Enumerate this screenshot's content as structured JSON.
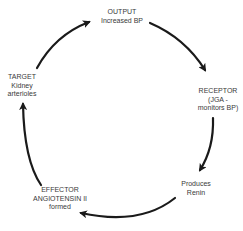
{
  "diagram": {
    "type": "cycle",
    "title": "",
    "colors": {
      "arrow": "#1a1a1a",
      "text": "#3a3a3a",
      "background": "#ffffff"
    },
    "nodes": [
      {
        "id": "output",
        "lines": [
          "OUTPUT",
          "Increased BP"
        ]
      },
      {
        "id": "receptor",
        "lines": [
          "RECEPTOR",
          "(JGA -",
          "monitors BP)"
        ]
      },
      {
        "id": "renin",
        "lines": [
          "Produces",
          "Renin"
        ]
      },
      {
        "id": "effector",
        "lines": [
          "EFFECTOR",
          "ANGIOTENSIN II",
          "formed"
        ]
      },
      {
        "id": "target",
        "lines": [
          "TARGET",
          "Kidney",
          "arterioles"
        ]
      }
    ],
    "edges": [
      {
        "from": "output",
        "to": "receptor",
        "direction": "clockwise"
      },
      {
        "from": "receptor",
        "to": "renin",
        "direction": "clockwise"
      },
      {
        "from": "renin",
        "to": "effector",
        "direction": "clockwise"
      },
      {
        "from": "effector",
        "to": "target",
        "direction": "clockwise"
      },
      {
        "from": "target",
        "to": "output",
        "direction": "clockwise"
      }
    ]
  }
}
